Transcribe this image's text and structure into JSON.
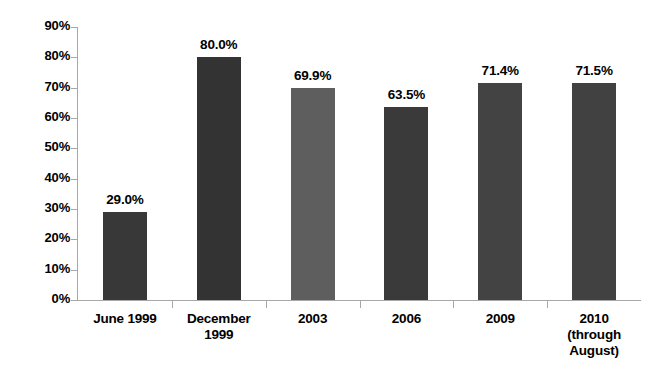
{
  "chart_data": {
    "type": "bar",
    "title": "",
    "subtitle": "",
    "xlabel": "",
    "ylabel": "",
    "ylim": [
      0,
      90
    ],
    "ytick_step": 10,
    "grid": false,
    "legend": "none",
    "categories": [
      "June 1999",
      "December 1999",
      "2003",
      "2006",
      "2009",
      "2010 (through August)"
    ],
    "category_label_lines": [
      [
        "June 1999"
      ],
      [
        "December",
        "1999"
      ],
      [
        "2003"
      ],
      [
        "2006"
      ],
      [
        "2009"
      ],
      [
        "2010",
        "(through",
        "August)"
      ]
    ],
    "values": [
      29.0,
      80.0,
      69.9,
      63.5,
      71.4,
      71.5
    ],
    "value_labels": [
      "29.0%",
      "80.0%",
      "69.9%",
      "63.5%",
      "71.4%",
      "71.5%"
    ],
    "bar_colors": [
      "#383838",
      "#333333",
      "#5e5e5e",
      "#3a3a3a",
      "#434343",
      "#414141"
    ],
    "ytick_labels": [
      "90%",
      "80%",
      "70%",
      "60%",
      "50%",
      "40%",
      "30%",
      "20%",
      "10%",
      "0%"
    ],
    "ytick_values": [
      90,
      80,
      70,
      60,
      50,
      40,
      30,
      20,
      10,
      0
    ]
  },
  "axis": {
    "line_color": "#a8a8a8"
  }
}
